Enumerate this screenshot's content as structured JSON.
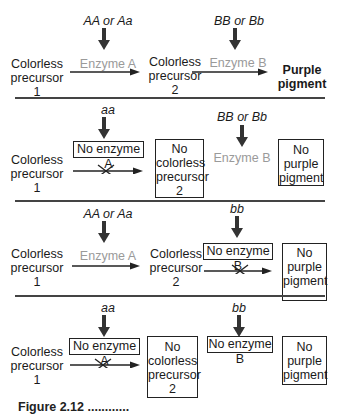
{
  "rows": [
    {
      "genotype_a": "AA or Aa",
      "genotype_b": "BB or Bb",
      "start": [
        "Colorless",
        "precursor",
        "1"
      ],
      "enzyme_a": "Enzyme A",
      "middle": [
        "Colorless",
        "precursor",
        "2"
      ],
      "enzyme_b": "Enzyme B",
      "end": [
        "Purple",
        "pigment"
      ]
    },
    {
      "genotype_a": "aa",
      "genotype_b": "BB or Bb",
      "start": [
        "Colorless",
        "precursor",
        "1"
      ],
      "enzyme_a": "No enzyme A",
      "middle": [
        "No",
        "colorless",
        "precursor",
        "2"
      ],
      "enzyme_b": "Enzyme B",
      "end": [
        "No",
        "purple",
        "pigment"
      ]
    },
    {
      "genotype_a": "AA or Aa",
      "genotype_b": "bb",
      "start": [
        "Colorless",
        "precursor",
        "1"
      ],
      "enzyme_a": "Enzyme A",
      "middle": [
        "Colorless",
        "precursor",
        "2"
      ],
      "enzyme_b": "No enzyme B",
      "end": [
        "No",
        "purple",
        "pigment"
      ]
    },
    {
      "genotype_a": "aa",
      "genotype_b": "bb",
      "start": [
        "Colorless",
        "precursor",
        "1"
      ],
      "enzyme_a": "No enzyme A",
      "middle": [
        "No",
        "colorless",
        "precursor",
        "2"
      ],
      "enzyme_b": "No enzyme B",
      "end": [
        "No",
        "purple",
        "pigment"
      ]
    }
  ],
  "caption": "Figure 2.12 ............",
  "colors": {
    "ink": "#1a1a1a",
    "enzyme_gray": "#9a9a9a",
    "divider": "#444444"
  }
}
